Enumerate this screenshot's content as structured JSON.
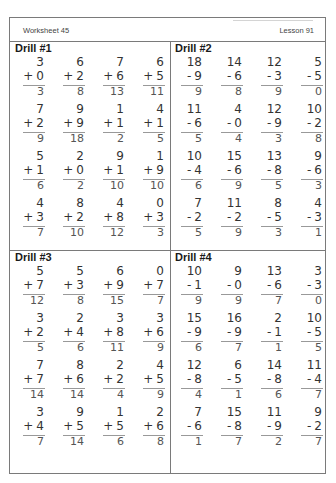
{
  "header": {
    "worksheet": "Worksheet 45",
    "lesson": "Lesson 91"
  },
  "drills": [
    {
      "title": "Drill #1",
      "operator": "+",
      "rows": [
        [
          {
            "a": "3",
            "b": "0",
            "ans": "3"
          },
          {
            "a": "6",
            "b": "2",
            "ans": "8"
          },
          {
            "a": "7",
            "b": "6",
            "ans": "13"
          },
          {
            "a": "6",
            "b": "5",
            "ans": "11"
          }
        ],
        [
          {
            "a": "7",
            "b": "2",
            "ans": "9"
          },
          {
            "a": "9",
            "b": "9",
            "ans": "18"
          },
          {
            "a": "1",
            "b": "1",
            "ans": "2"
          },
          {
            "a": "4",
            "b": "1",
            "ans": "5"
          }
        ],
        [
          {
            "a": "5",
            "b": "1",
            "ans": "6"
          },
          {
            "a": "2",
            "b": "0",
            "ans": "2"
          },
          {
            "a": "9",
            "b": "1",
            "ans": "10"
          },
          {
            "a": "1",
            "b": "9",
            "ans": "10"
          }
        ],
        [
          {
            "a": "4",
            "b": "3",
            "ans": "7"
          },
          {
            "a": "8",
            "b": "2",
            "ans": "10"
          },
          {
            "a": "4",
            "b": "8",
            "ans": "12"
          },
          {
            "a": "0",
            "b": "3",
            "ans": "3"
          }
        ]
      ]
    },
    {
      "title": "Drill #2",
      "operator": "-",
      "rows": [
        [
          {
            "a": "18",
            "b": "9",
            "ans": "9"
          },
          {
            "a": "14",
            "b": "6",
            "ans": "8"
          },
          {
            "a": "12",
            "b": "3",
            "ans": "9"
          },
          {
            "a": "5",
            "b": "5",
            "ans": "0"
          }
        ],
        [
          {
            "a": "11",
            "b": "6",
            "ans": "5"
          },
          {
            "a": "4",
            "b": "0",
            "ans": "4"
          },
          {
            "a": "12",
            "b": "9",
            "ans": "3"
          },
          {
            "a": "10",
            "b": "2",
            "ans": "8"
          }
        ],
        [
          {
            "a": "10",
            "b": "4",
            "ans": "6"
          },
          {
            "a": "15",
            "b": "6",
            "ans": "9"
          },
          {
            "a": "13",
            "b": "8",
            "ans": "5"
          },
          {
            "a": "9",
            "b": "6",
            "ans": "3"
          }
        ],
        [
          {
            "a": "7",
            "b": "2",
            "ans": "5"
          },
          {
            "a": "11",
            "b": "2",
            "ans": "9"
          },
          {
            "a": "8",
            "b": "5",
            "ans": "3"
          },
          {
            "a": "4",
            "b": "3",
            "ans": "1"
          }
        ]
      ]
    },
    {
      "title": "Drill #3",
      "operator": "+",
      "rows": [
        [
          {
            "a": "5",
            "b": "7",
            "ans": "12"
          },
          {
            "a": "5",
            "b": "3",
            "ans": "8"
          },
          {
            "a": "6",
            "b": "9",
            "ans": "15"
          },
          {
            "a": "0",
            "b": "7",
            "ans": "7"
          }
        ],
        [
          {
            "a": "3",
            "b": "2",
            "ans": "5"
          },
          {
            "a": "2",
            "b": "4",
            "ans": "6"
          },
          {
            "a": "3",
            "b": "8",
            "ans": "11"
          },
          {
            "a": "3",
            "b": "6",
            "ans": "9"
          }
        ],
        [
          {
            "a": "7",
            "b": "7",
            "ans": "14"
          },
          {
            "a": "8",
            "b": "6",
            "ans": "14"
          },
          {
            "a": "2",
            "b": "2",
            "ans": "4"
          },
          {
            "a": "4",
            "b": "5",
            "ans": "9"
          }
        ],
        [
          {
            "a": "3",
            "b": "4",
            "ans": "7"
          },
          {
            "a": "9",
            "b": "5",
            "ans": "14"
          },
          {
            "a": "1",
            "b": "5",
            "ans": "6"
          },
          {
            "a": "2",
            "b": "6",
            "ans": "8"
          }
        ]
      ]
    },
    {
      "title": "Drill #4",
      "operator": "-",
      "rows": [
        [
          {
            "a": "10",
            "b": "1",
            "ans": "9"
          },
          {
            "a": "9",
            "b": "0",
            "ans": "9"
          },
          {
            "a": "13",
            "b": "6",
            "ans": "7"
          },
          {
            "a": "3",
            "b": "3",
            "ans": "0"
          }
        ],
        [
          {
            "a": "15",
            "b": "9",
            "ans": "6"
          },
          {
            "a": "16",
            "b": "9",
            "ans": "7"
          },
          {
            "a": "2",
            "b": "1",
            "ans": "1"
          },
          {
            "a": "10",
            "b": "5",
            "ans": "5"
          }
        ],
        [
          {
            "a": "12",
            "b": "8",
            "ans": "4"
          },
          {
            "a": "6",
            "b": "5",
            "ans": "1"
          },
          {
            "a": "14",
            "b": "8",
            "ans": "6"
          },
          {
            "a": "11",
            "b": "4",
            "ans": "7"
          }
        ],
        [
          {
            "a": "7",
            "b": "6",
            "ans": "1"
          },
          {
            "a": "15",
            "b": "8",
            "ans": "7"
          },
          {
            "a": "11",
            "b": "9",
            "ans": "2"
          },
          {
            "a": "9",
            "b": "2",
            "ans": "7"
          }
        ]
      ]
    }
  ]
}
